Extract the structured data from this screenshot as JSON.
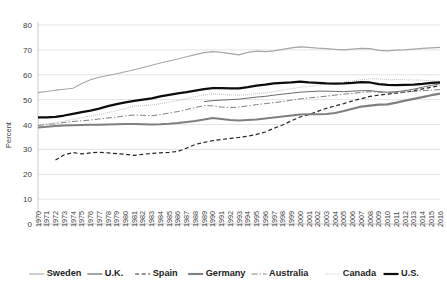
{
  "chart_data": {
    "type": "line",
    "title": "",
    "subtitle": "",
    "xlabel": "",
    "ylabel": "Percent",
    "ylim": [
      0,
      80
    ],
    "yticks": [
      0,
      10,
      20,
      30,
      40,
      50,
      60,
      70,
      80
    ],
    "ytick_labels": [
      "0",
      "10",
      "20",
      "30",
      "40",
      "50",
      "60",
      "70",
      "80"
    ],
    "grid": true,
    "legend_position": "bottom",
    "x": [
      1970,
      1971,
      1972,
      1973,
      1974,
      1975,
      1976,
      1977,
      1978,
      1979,
      1980,
      1981,
      1982,
      1983,
      1984,
      1985,
      1986,
      1987,
      1988,
      1989,
      1990,
      1991,
      1992,
      1993,
      1994,
      1995,
      1996,
      1997,
      1998,
      1999,
      2000,
      2001,
      2002,
      2003,
      2004,
      2005,
      2006,
      2007,
      2008,
      2009,
      2010,
      2011,
      2012,
      2013,
      2014,
      2015,
      2016
    ],
    "xtick_labels": [
      "1970",
      "1971",
      "1972",
      "1973",
      "1974",
      "1975",
      "1976",
      "1977",
      "1978",
      "1979",
      "1980",
      "1981",
      "1982",
      "1983",
      "1984",
      "1985",
      "1986",
      "1987",
      "1988",
      "1989",
      "1990",
      "1991",
      "1992",
      "1993",
      "1994",
      "1995",
      "1996",
      "1997",
      "1998",
      "1999",
      "2000",
      "2001",
      "2002",
      "2003",
      "2004",
      "2005",
      "2006",
      "2007",
      "2008",
      "2009",
      "2010",
      "2011",
      "2012",
      "2013",
      "2014",
      "2015",
      "2016"
    ],
    "series": [
      {
        "name": "Sweden",
        "color": "#a6a6a6",
        "width": 1.1,
        "dash": "none",
        "values": [
          52.8,
          53.3,
          53.8,
          54.2,
          54.6,
          56.5,
          58.0,
          59.0,
          59.7,
          60.4,
          61.2,
          62.0,
          62.9,
          63.8,
          64.7,
          65.5,
          66.3,
          67.2,
          68.1,
          68.9,
          69.3,
          69.0,
          68.5,
          68.0,
          69.0,
          69.5,
          69.3,
          69.6,
          70.2,
          70.8,
          71.2,
          71.0,
          70.7,
          70.5,
          70.2,
          70.0,
          70.3,
          70.6,
          70.5,
          69.8,
          69.6,
          69.9,
          70.0,
          70.3,
          70.6,
          70.8,
          71.0
        ]
      },
      {
        "name": "U.K.",
        "color": "#595959",
        "width": 0.9,
        "dash": "none",
        "values": [
          null,
          null,
          null,
          null,
          null,
          null,
          null,
          null,
          null,
          null,
          null,
          null,
          null,
          null,
          null,
          null,
          null,
          null,
          null,
          49.2,
          49.6,
          49.8,
          50.0,
          50.2,
          50.6,
          51.0,
          51.3,
          51.8,
          52.2,
          52.6,
          53.0,
          53.2,
          53.4,
          53.4,
          53.3,
          53.2,
          53.4,
          53.6,
          53.6,
          53.2,
          53.0,
          53.2,
          53.6,
          54.2,
          55.0,
          55.7,
          56.4
        ]
      },
      {
        "name": "Spain",
        "color": "#262626",
        "width": 1.2,
        "dash": "4,2.6",
        "values": [
          null,
          null,
          25.7,
          27.8,
          28.7,
          28.2,
          28.6,
          28.8,
          28.6,
          28.3,
          28.0,
          27.6,
          28.0,
          28.4,
          28.6,
          28.8,
          29.2,
          30.5,
          32.0,
          32.8,
          33.5,
          34.0,
          34.4,
          34.8,
          35.3,
          36.0,
          37.0,
          38.5,
          39.8,
          41.5,
          43.0,
          44.0,
          45.3,
          46.5,
          47.5,
          48.4,
          49.5,
          50.4,
          51.3,
          51.8,
          52.2,
          52.6,
          53.0,
          53.6,
          54.3,
          55.0,
          55.6
        ]
      },
      {
        "name": "Germany",
        "color": "#7f7f7f",
        "width": 2.1,
        "dash": "none",
        "values": [
          38.8,
          39.1,
          39.4,
          39.6,
          39.7,
          39.8,
          39.9,
          39.9,
          40.0,
          40.1,
          40.2,
          40.2,
          40.1,
          40.0,
          40.1,
          40.3,
          40.6,
          41.0,
          41.4,
          42.0,
          42.6,
          42.2,
          41.8,
          41.6,
          41.8,
          42.0,
          42.4,
          42.8,
          43.2,
          43.6,
          44.0,
          44.1,
          44.1,
          44.2,
          44.6,
          45.4,
          46.3,
          47.2,
          47.6,
          48.0,
          48.1,
          48.8,
          49.6,
          50.3,
          51.0,
          51.8,
          52.4
        ]
      },
      {
        "name": "Australia",
        "color": "#808080",
        "width": 1.0,
        "dash": "6,2,1.4,2",
        "values": [
          39.6,
          40.0,
          40.3,
          40.8,
          41.2,
          41.5,
          41.8,
          42.2,
          42.6,
          43.0,
          43.5,
          43.8,
          43.7,
          43.5,
          44.0,
          44.6,
          45.2,
          46.0,
          46.8,
          47.6,
          47.5,
          47.0,
          46.8,
          47.0,
          47.5,
          48.0,
          48.4,
          48.8,
          49.2,
          49.8,
          50.3,
          50.7,
          51.0,
          51.4,
          51.8,
          52.2,
          52.5,
          52.9,
          53.2,
          53.0,
          52.8,
          52.8,
          53.0,
          53.3,
          53.6,
          53.8,
          54.0
        ]
      },
      {
        "name": "Canada",
        "color": "#bfbfbf",
        "width": 1.1,
        "dash": "0.9,1.1",
        "values": [
          39.9,
          40.3,
          40.7,
          41.3,
          42.0,
          42.8,
          43.4,
          44.0,
          44.8,
          45.6,
          46.5,
          47.4,
          47.6,
          47.8,
          48.4,
          49.0,
          49.6,
          50.4,
          51.2,
          51.9,
          52.3,
          52.1,
          51.9,
          51.8,
          52.0,
          52.4,
          52.7,
          53.2,
          53.8,
          54.4,
          55.0,
          55.3,
          55.8,
          56.4,
          56.8,
          57.1,
          57.5,
          58.0,
          58.4,
          58.3,
          58.0,
          58.1,
          58.0,
          57.9,
          57.8,
          57.6,
          57.4
        ]
      },
      {
        "name": "U.S.",
        "color": "#0d0d0d",
        "width": 2.2,
        "dash": "none",
        "values": [
          42.9,
          42.9,
          43.1,
          43.6,
          44.3,
          45.0,
          45.6,
          46.4,
          47.4,
          48.2,
          48.9,
          49.5,
          50.0,
          50.5,
          51.3,
          51.9,
          52.5,
          53.0,
          53.6,
          54.2,
          54.6,
          54.6,
          54.5,
          54.5,
          55.0,
          55.6,
          56.0,
          56.5,
          56.7,
          56.9,
          57.2,
          56.9,
          56.7,
          56.5,
          56.4,
          56.5,
          56.7,
          57.0,
          56.9,
          56.2,
          55.9,
          55.8,
          55.9,
          56.0,
          56.3,
          56.7,
          56.9
        ]
      }
    ]
  },
  "legend": {
    "items": [
      {
        "label": "Sweden",
        "swatch": "sweden-line-swatch"
      },
      {
        "label": "U.K.",
        "swatch": "uk-line-swatch"
      },
      {
        "label": "Spain",
        "swatch": "spain-line-swatch"
      },
      {
        "label": "Germany",
        "swatch": "germany-line-swatch"
      },
      {
        "label": "Australia",
        "swatch": "australia-line-swatch"
      },
      {
        "label": "Canada",
        "swatch": "canada-line-swatch"
      },
      {
        "label": "U.S.",
        "swatch": "us-line-swatch"
      }
    ]
  }
}
